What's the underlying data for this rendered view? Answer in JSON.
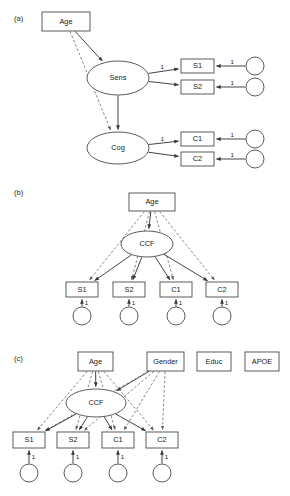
{
  "figure": {
    "width": 290,
    "height": 496,
    "background": "#ffffff",
    "stroke_solid": "#3a3a3a",
    "stroke_dashed": "#6a6a6a",
    "node_stroke": "#4a4a4a",
    "node_fill": "#ffffff"
  },
  "panels": [
    {
      "id": "panel-a",
      "label": "(a)",
      "label_x": 14,
      "label_y": 19,
      "nodes": [
        {
          "name": "age",
          "label": "Age",
          "shape": "rect",
          "x": 42,
          "y": 12,
          "w": 48,
          "h": 19
        },
        {
          "name": "sens",
          "label": "Sens",
          "shape": "ellipse",
          "cx": 118,
          "cy": 78,
          "rx": 31,
          "ry": 17
        },
        {
          "name": "cog",
          "label": "Cog",
          "shape": "ellipse",
          "cx": 118,
          "cy": 148,
          "rx": 31,
          "ry": 16
        },
        {
          "name": "s1",
          "label": "S1",
          "shape": "rect",
          "x": 181,
          "y": 59,
          "w": 33,
          "h": 14
        },
        {
          "name": "s2",
          "label": "S2",
          "shape": "rect",
          "x": 181,
          "y": 80,
          "w": 33,
          "h": 14
        },
        {
          "name": "c1",
          "label": "C1",
          "shape": "rect",
          "x": 181,
          "y": 132,
          "w": 33,
          "h": 14
        },
        {
          "name": "c2",
          "label": "C2",
          "shape": "rect",
          "x": 181,
          "y": 152,
          "w": 33,
          "h": 14
        },
        {
          "name": "e-s1",
          "label": "",
          "shape": "circle",
          "cx": 255,
          "cy": 66,
          "r": 9
        },
        {
          "name": "e-s2",
          "label": "",
          "shape": "circle",
          "cx": 255,
          "cy": 87,
          "r": 9
        },
        {
          "name": "e-c1",
          "label": "",
          "shape": "circle",
          "cx": 255,
          "cy": 139,
          "r": 9
        },
        {
          "name": "e-c2",
          "label": "",
          "shape": "circle",
          "cx": 255,
          "cy": 159,
          "r": 9
        }
      ],
      "edges": [
        {
          "name": "age-to-sens",
          "from": "age",
          "to": "sens",
          "style": "solid",
          "label": ""
        },
        {
          "name": "age-to-cog",
          "from": "age",
          "to": "cog",
          "style": "dashed",
          "label": ""
        },
        {
          "name": "sens-to-cog",
          "from": "sens",
          "to": "cog",
          "style": "solid",
          "label": ""
        },
        {
          "name": "sens-to-s1",
          "from": "sens",
          "to": "s1",
          "style": "solid",
          "label": "1"
        },
        {
          "name": "sens-to-s2",
          "from": "sens",
          "to": "s2",
          "style": "solid",
          "label": ""
        },
        {
          "name": "cog-to-c1",
          "from": "cog",
          "to": "c1",
          "style": "solid",
          "label": "1"
        },
        {
          "name": "cog-to-c2",
          "from": "cog",
          "to": "c2",
          "style": "solid",
          "label": ""
        },
        {
          "name": "es1-to-s1",
          "from": "e-s1",
          "to": "s1",
          "style": "solid",
          "label": "1"
        },
        {
          "name": "es2-to-s2",
          "from": "e-s2",
          "to": "s2",
          "style": "solid",
          "label": "1"
        },
        {
          "name": "ec1-to-c1",
          "from": "e-c1",
          "to": "c1",
          "style": "solid",
          "label": "1"
        },
        {
          "name": "ec2-to-c2",
          "from": "e-c2",
          "to": "c2",
          "style": "solid",
          "label": "1"
        }
      ]
    },
    {
      "id": "panel-b",
      "label": "(b)",
      "label_x": 14,
      "label_y": 193,
      "nodes": [
        {
          "name": "age",
          "label": "Age",
          "shape": "rect",
          "x": 129,
          "y": 193,
          "w": 46,
          "h": 18
        },
        {
          "name": "ccf",
          "label": "CCF",
          "shape": "ellipse",
          "cx": 147,
          "cy": 244,
          "rx": 26,
          "ry": 13
        },
        {
          "name": "s1",
          "label": "S1",
          "shape": "rect",
          "x": 66,
          "y": 282,
          "w": 32,
          "h": 15
        },
        {
          "name": "s2",
          "label": "S2",
          "shape": "rect",
          "x": 113,
          "y": 282,
          "w": 32,
          "h": 15
        },
        {
          "name": "c1",
          "label": "C1",
          "shape": "rect",
          "x": 160,
          "y": 282,
          "w": 32,
          "h": 15
        },
        {
          "name": "c2",
          "label": "C2",
          "shape": "rect",
          "x": 206,
          "y": 282,
          "w": 32,
          "h": 15
        },
        {
          "name": "e-s1",
          "label": "",
          "shape": "circle",
          "cx": 82,
          "cy": 316,
          "r": 9
        },
        {
          "name": "e-s2",
          "label": "",
          "shape": "circle",
          "cx": 129,
          "cy": 316,
          "r": 9
        },
        {
          "name": "e-c1",
          "label": "",
          "shape": "circle",
          "cx": 176,
          "cy": 316,
          "r": 9
        },
        {
          "name": "e-c2",
          "label": "",
          "shape": "circle",
          "cx": 222,
          "cy": 316,
          "r": 9
        }
      ],
      "edges": [
        {
          "name": "age-to-ccf",
          "from": "age",
          "to": "ccf",
          "style": "solid",
          "label": ""
        },
        {
          "name": "age-to-s1",
          "from": "age",
          "to": "s1",
          "style": "dashed",
          "label": ""
        },
        {
          "name": "age-to-s2",
          "from": "age",
          "to": "s2",
          "style": "dashed",
          "label": ""
        },
        {
          "name": "age-to-c1",
          "from": "age",
          "to": "c1",
          "style": "dashed",
          "label": ""
        },
        {
          "name": "age-to-c2",
          "from": "age",
          "to": "c2",
          "style": "dashed",
          "label": ""
        },
        {
          "name": "ccf-to-s1",
          "from": "ccf",
          "to": "s1",
          "style": "solid",
          "label": ""
        },
        {
          "name": "ccf-to-s2",
          "from": "ccf",
          "to": "s2",
          "style": "solid",
          "label": ""
        },
        {
          "name": "ccf-to-c1",
          "from": "ccf",
          "to": "c1",
          "style": "solid",
          "label": ""
        },
        {
          "name": "ccf-to-c2",
          "from": "ccf",
          "to": "c2",
          "style": "solid",
          "label": ""
        },
        {
          "name": "es1-to-s1",
          "from": "e-s1",
          "to": "s1",
          "style": "solid",
          "label": "1"
        },
        {
          "name": "es2-to-s2",
          "from": "e-s2",
          "to": "s2",
          "style": "solid",
          "label": "1"
        },
        {
          "name": "ec1-to-c1",
          "from": "e-c1",
          "to": "c1",
          "style": "solid",
          "label": "1"
        },
        {
          "name": "ec2-to-c2",
          "from": "e-c2",
          "to": "c2",
          "style": "solid",
          "label": "1"
        }
      ]
    },
    {
      "id": "panel-c",
      "label": "(c)",
      "label_x": 14,
      "label_y": 359,
      "nodes": [
        {
          "name": "age",
          "label": "Age",
          "shape": "rect",
          "x": 78,
          "y": 352,
          "w": 35,
          "h": 19
        },
        {
          "name": "gender",
          "label": "Gender",
          "shape": "rect",
          "x": 147,
          "y": 352,
          "w": 37,
          "h": 19
        },
        {
          "name": "educ",
          "label": "Educ",
          "shape": "rect",
          "x": 197,
          "y": 352,
          "w": 34,
          "h": 19
        },
        {
          "name": "apoe",
          "label": "APOE",
          "shape": "rect",
          "x": 245,
          "y": 352,
          "w": 34,
          "h": 19
        },
        {
          "name": "ccf",
          "label": "CCF",
          "shape": "ellipse",
          "cx": 96,
          "cy": 403,
          "rx": 30,
          "ry": 14
        },
        {
          "name": "s1",
          "label": "S1",
          "shape": "rect",
          "x": 13,
          "y": 432,
          "w": 32,
          "h": 16
        },
        {
          "name": "s2",
          "label": "S2",
          "shape": "rect",
          "x": 57,
          "y": 432,
          "w": 32,
          "h": 16
        },
        {
          "name": "c1",
          "label": "C1",
          "shape": "rect",
          "x": 102,
          "y": 432,
          "w": 32,
          "h": 16
        },
        {
          "name": "c2",
          "label": "C2",
          "shape": "rect",
          "x": 146,
          "y": 432,
          "w": 32,
          "h": 16
        },
        {
          "name": "e-s1",
          "label": "",
          "shape": "circle",
          "cx": 29,
          "cy": 473,
          "r": 9
        },
        {
          "name": "e-s2",
          "label": "",
          "shape": "circle",
          "cx": 73,
          "cy": 473,
          "r": 9
        },
        {
          "name": "e-c1",
          "label": "",
          "shape": "circle",
          "cx": 118,
          "cy": 473,
          "r": 9
        },
        {
          "name": "e-c2",
          "label": "",
          "shape": "circle",
          "cx": 162,
          "cy": 473,
          "r": 9
        }
      ],
      "edges": [
        {
          "name": "age-to-ccf",
          "from": "age",
          "to": "ccf",
          "style": "solid",
          "label": ""
        },
        {
          "name": "age-to-s1",
          "from": "age",
          "to": "s1",
          "style": "dashed",
          "label": ""
        },
        {
          "name": "age-to-s2",
          "from": "age",
          "to": "s2",
          "style": "dashed",
          "label": ""
        },
        {
          "name": "age-to-c1",
          "from": "age",
          "to": "c1",
          "style": "dashed",
          "label": ""
        },
        {
          "name": "age-to-c2",
          "from": "age",
          "to": "c2",
          "style": "dashed",
          "label": ""
        },
        {
          "name": "gender-to-ccf",
          "from": "gender",
          "to": "ccf",
          "style": "solid",
          "label": ""
        },
        {
          "name": "gender-to-s1",
          "from": "gender",
          "to": "s1",
          "style": "dashed",
          "label": ""
        },
        {
          "name": "gender-to-s2",
          "from": "gender",
          "to": "s2",
          "style": "dashed",
          "label": ""
        },
        {
          "name": "gender-to-c1",
          "from": "gender",
          "to": "c1",
          "style": "dashed",
          "label": ""
        },
        {
          "name": "gender-to-c2",
          "from": "gender",
          "to": "c2",
          "style": "dashed",
          "label": ""
        },
        {
          "name": "ccf-to-s1",
          "from": "ccf",
          "to": "s1",
          "style": "solid",
          "label": ""
        },
        {
          "name": "ccf-to-s2",
          "from": "ccf",
          "to": "s2",
          "style": "solid",
          "label": ""
        },
        {
          "name": "ccf-to-c1",
          "from": "ccf",
          "to": "c1",
          "style": "solid",
          "label": ""
        },
        {
          "name": "ccf-to-c2",
          "from": "ccf",
          "to": "c2",
          "style": "solid",
          "label": ""
        },
        {
          "name": "es1-to-s1",
          "from": "e-s1",
          "to": "s1",
          "style": "solid",
          "label": "1"
        },
        {
          "name": "es2-to-s2",
          "from": "e-s2",
          "to": "s2",
          "style": "solid",
          "label": "1"
        },
        {
          "name": "ec1-to-c1",
          "from": "e-c1",
          "to": "c1",
          "style": "solid",
          "label": "1"
        },
        {
          "name": "ec2-to-c2",
          "from": "e-c2",
          "to": "c2",
          "style": "solid",
          "label": "1"
        }
      ]
    }
  ]
}
